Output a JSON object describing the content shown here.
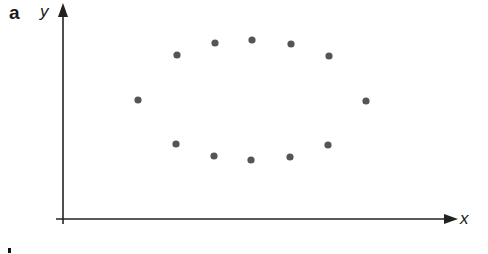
{
  "figure": {
    "panel_label": "a",
    "point_color": "#555555",
    "axis_color": "#222222"
  },
  "chart_data": {
    "type": "scatter",
    "title": "",
    "xlabel": "x",
    "ylabel": "y",
    "grid": false,
    "legend": null,
    "note": "Axes without tick marks or numeric labels; 12 points arranged in an oval. Coordinates in approximate pixel-based units relative to origin (x right, y up).",
    "points": [
      {
        "x": 75,
        "y": 119
      },
      {
        "x": 114,
        "y": 164
      },
      {
        "x": 152,
        "y": 176
      },
      {
        "x": 189,
        "y": 179
      },
      {
        "x": 228,
        "y": 175
      },
      {
        "x": 266,
        "y": 163
      },
      {
        "x": 303,
        "y": 118
      },
      {
        "x": 113,
        "y": 75
      },
      {
        "x": 151,
        "y": 63
      },
      {
        "x": 188,
        "y": 59
      },
      {
        "x": 227,
        "y": 62
      },
      {
        "x": 265,
        "y": 74
      }
    ],
    "x": [
      75,
      114,
      152,
      189,
      228,
      266,
      303,
      113,
      151,
      188,
      227,
      265
    ],
    "y": [
      119,
      164,
      176,
      179,
      175,
      163,
      118,
      75,
      63,
      59,
      62,
      74
    ]
  }
}
